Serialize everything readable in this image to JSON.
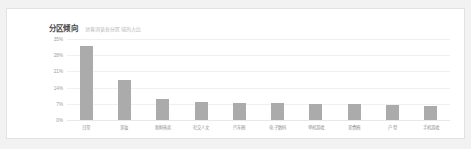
{
  "card": {
    "background_color": "#ffffff",
    "border_color": "#e2e2e2"
  },
  "header": {
    "title": "分区倾向",
    "subtitle": "访客浏览各分区域的占比"
  },
  "chart_data": {
    "type": "bar",
    "title": "分区倾向",
    "subtitle": "访客浏览各分区域的占比",
    "xlabel": "",
    "ylabel": "",
    "ylim": [
      0,
      35
    ],
    "grid": true,
    "legend": "none",
    "bar_color": "#ababab",
    "y_ticks": [
      "0%",
      "7%",
      "14%",
      "21%",
      "28%",
      "35%"
    ],
    "y_tick_values": [
      0,
      7,
      14,
      21,
      28,
      35
    ],
    "categories": [
      "日常",
      "美妆",
      "新鲜热卖",
      "社交人文",
      "汽车圈",
      "电子数码",
      "单机游戏",
      "美食圈",
      "户型",
      "手机游戏"
    ],
    "values": [
      32,
      17.5,
      9,
      7.8,
      7.4,
      7.2,
      7.0,
      7.0,
      6.4,
      6.2
    ]
  }
}
